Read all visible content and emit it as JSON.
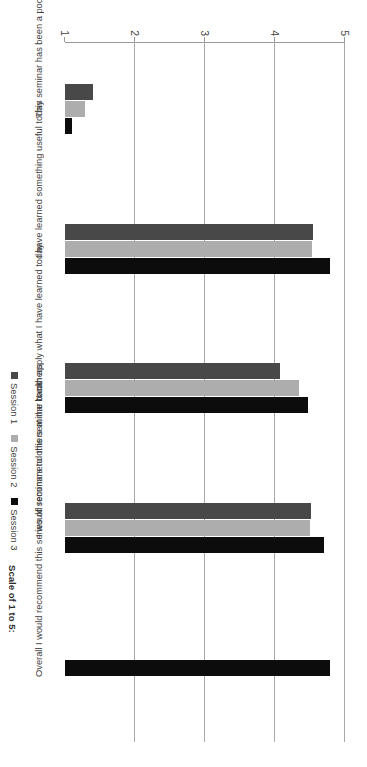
{
  "chart_data": {
    "type": "bar",
    "title": "",
    "subtitle": "",
    "orientation": "vertical-bars-rotated-page",
    "xlabel": "",
    "ylabel": "",
    "ylim": [
      1,
      5
    ],
    "yticks": [
      1,
      2,
      3,
      4,
      5
    ],
    "ytick_labels": [
      "1",
      "2",
      "3",
      "4",
      "5"
    ],
    "grid": true,
    "legend_position": "bottom-right",
    "categories": [
      "This seminar has been a poor use of my time",
      "I have learned something useful today",
      "I can apply what I have learned today",
      "I would recommend this seminar to others",
      "Overall I would recommend this series of seminars to others at the bank"
    ],
    "series": [
      {
        "name": "Session 1",
        "color": "#484848",
        "values": [
          1.4,
          4.55,
          4.07,
          4.52,
          null
        ]
      },
      {
        "name": "Session 2",
        "color": "#adadad",
        "values": [
          1.28,
          4.53,
          4.35,
          4.5,
          null
        ]
      },
      {
        "name": "Session 3",
        "color": "#0c0c0c",
        "values": [
          1.1,
          4.78,
          4.47,
          4.7,
          4.78
        ]
      }
    ],
    "annotations": [
      "Scale of 1 to 5:"
    ]
  },
  "legend": {
    "items": [
      {
        "label": "Session 1",
        "color": "#484848"
      },
      {
        "label": "Session 2",
        "color": "#adadad"
      },
      {
        "label": "Session 3",
        "color": "#0c0c0c"
      }
    ]
  },
  "notes": {
    "scale": "Scale of 1 to 5:"
  },
  "axis": {
    "ticks": [
      "1",
      "2",
      "3",
      "4",
      "5"
    ]
  }
}
